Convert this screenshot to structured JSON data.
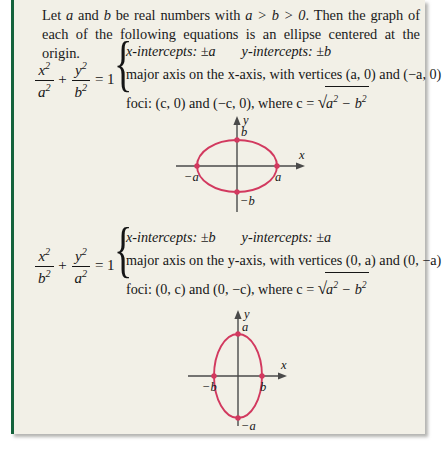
{
  "panel": {
    "accent_color": "#14633c",
    "background_color": "#f2f0e7",
    "curve_color": "#d2395f",
    "axis_color": "#4a4a4a"
  },
  "intro": {
    "part1": "Let ",
    "a": "a",
    "part2": " and ",
    "b": "b",
    "part3": " be real numbers with ",
    "condition": "a > b > 0",
    "part4": ". Then the graph of each of the following equations is an ellipse centered at the origin."
  },
  "blocks": [
    {
      "equation": {
        "frac1": {
          "num": "x",
          "num_exp": "2",
          "den": "a",
          "den_exp": "2"
        },
        "plus": "+",
        "frac2": {
          "num": "y",
          "num_exp": "2",
          "den": "b",
          "den_exp": "2"
        },
        "equals": "= 1"
      },
      "brace": "{",
      "line1_left_label": "x-intercepts:",
      "line1_left_value": "±a",
      "line1_right_label": "y-intercepts:",
      "line1_right_value": "±b",
      "line2": "major axis on the x-axis, with vertices (a, 0) and (−a, 0)",
      "line3_prefix": "foci: (c, 0) and (−c, 0), where c =",
      "line3_radicand_a": "a",
      "line3_radicand_minus": "−",
      "line3_radicand_b": "b",
      "graph": {
        "orientation": "horizontal",
        "x_axis_label": "x",
        "y_axis_label": "y",
        "top_label": "b",
        "bottom_label": "−b",
        "left_label": "−a",
        "right_label": "a",
        "semi_x": 40,
        "semi_y": 26
      }
    },
    {
      "equation": {
        "frac1": {
          "num": "x",
          "num_exp": "2",
          "den": "b",
          "den_exp": "2"
        },
        "plus": "+",
        "frac2": {
          "num": "y",
          "num_exp": "2",
          "den": "a",
          "den_exp": "2"
        },
        "equals": "= 1"
      },
      "brace": "{",
      "line1_left_label": "x-intercepts:",
      "line1_left_value": "±b",
      "line1_right_label": "y-intercepts:",
      "line1_right_value": "±a",
      "line2": "major axis on the y-axis, with vertices (0, a) and (0, −a)",
      "line3_prefix": "foci: (0, c) and (0, −c), where c =",
      "line3_radicand_a": "a",
      "line3_radicand_minus": "−",
      "line3_radicand_b": "b",
      "graph": {
        "orientation": "vertical",
        "x_axis_label": "x",
        "y_axis_label": "y",
        "top_label": "a",
        "bottom_label": "−a",
        "left_label": "−b",
        "right_label": "b",
        "semi_x": 24,
        "semi_y": 42
      }
    }
  ]
}
